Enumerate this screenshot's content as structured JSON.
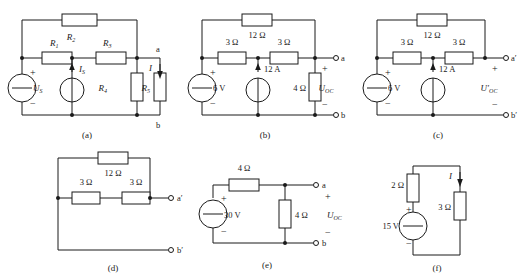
{
  "figure": {
    "type": "circuit-diagram-set",
    "subfigure_count": 6,
    "captions": [
      "(a)",
      "(b)",
      "(c)",
      "(d)",
      "(e)",
      "(f)"
    ]
  },
  "circuits": {
    "a": {
      "caption": "(a)",
      "components": {
        "r1": "R",
        "r1_sub": "1",
        "r2": "R",
        "r2_sub": "2",
        "r3": "R",
        "r3_sub": "3",
        "r4": "R",
        "r4_sub": "4",
        "r5": "R",
        "r5_sub": "5",
        "vsource": "U",
        "vsource_sub": "S",
        "isource": "I",
        "isource_sub": "S",
        "current": "I"
      },
      "terminals": {
        "top": "a",
        "bottom": "b"
      },
      "signs": {
        "plus": "+",
        "minus": "−"
      }
    },
    "b": {
      "caption": "(b)",
      "components": {
        "r_top": "12 Ω",
        "r_left": "3 Ω",
        "r_right": "3 Ω",
        "r_shunt": "4 Ω",
        "vsource": "6 V",
        "isource": "12 A",
        "output": "U",
        "output_sub": "OC"
      },
      "terminals": {
        "top": "a",
        "bottom": "b"
      },
      "signs": {
        "plus": "+",
        "minus": "−"
      }
    },
    "c": {
      "caption": "(c)",
      "components": {
        "r_top": "12 Ω",
        "r_left": "3 Ω",
        "r_right": "3 Ω",
        "vsource": "6 V",
        "isource": "12 A",
        "output": "U′",
        "output_sub": "OC"
      },
      "terminals": {
        "top": "a′",
        "bottom": "b′"
      },
      "signs": {
        "plus": "+",
        "minus": "−"
      }
    },
    "d": {
      "caption": "(d)",
      "components": {
        "r_top": "12 Ω",
        "r_left": "3 Ω",
        "r_right": "3 Ω"
      },
      "terminals": {
        "top": "a′",
        "bottom": "b′"
      }
    },
    "e": {
      "caption": "(e)",
      "components": {
        "r_series": "4 Ω",
        "r_shunt": "4 Ω",
        "vsource": "30 V",
        "output": "U",
        "output_sub": "OC"
      },
      "terminals": {
        "top": "a",
        "bottom": "b"
      },
      "signs": {
        "plus": "+",
        "minus": "−"
      }
    },
    "f": {
      "caption": "(f)",
      "components": {
        "r_left": "2 Ω",
        "r_right": "3 Ω",
        "vsource": "15 V",
        "current": "I"
      },
      "signs": {
        "plus": "+",
        "minus": "−"
      }
    }
  }
}
